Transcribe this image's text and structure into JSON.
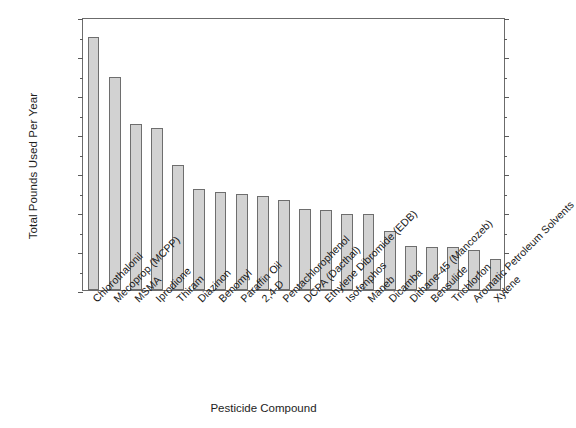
{
  "chart_data": {
    "type": "bar",
    "title": "",
    "xlabel": "Pesticide Compound",
    "ylabel": "Total Pounds Used Per Year",
    "ylim": [
      0,
      1400000
    ],
    "ytick_step": 200000,
    "yminor_step": 100000,
    "grid": false,
    "legend": null,
    "bar_color": "#d2d2d2",
    "bar_edge_color": "#6e6e6e",
    "axis_color": "#6b6b6b",
    "ytick_labels": [
      "0",
      "200,000",
      "400,000",
      "600,000",
      "800,000",
      "1,000,000",
      "1,200,000",
      "1,400,000"
    ],
    "ytick_values": [
      0,
      200000,
      400000,
      600000,
      800000,
      1000000,
      1200000,
      1400000
    ],
    "categories": [
      "Chlorothalonil",
      "Mecoprop (MCPP)",
      "MSMA",
      "Iprodione",
      "Thiram",
      "Diazinon",
      "Benomyl",
      "Paraffin Oil",
      "2,4-D",
      "Pentachlorophenol",
      "DCPA (Dacthal)",
      "Ethylene Dibromide (EDB)",
      "Isofenphos",
      "Maneb",
      "Dicamba",
      "Dithane-45 (Mancozeb)",
      "Bensulide",
      "Trichlorfon",
      "Aromatic Petroleum Solvents",
      "Xylene"
    ],
    "values": [
      1300000,
      1090000,
      850000,
      830000,
      640000,
      520000,
      505000,
      490000,
      480000,
      460000,
      415000,
      410000,
      390000,
      390000,
      305000,
      225000,
      220000,
      220000,
      205000,
      160000
    ]
  }
}
